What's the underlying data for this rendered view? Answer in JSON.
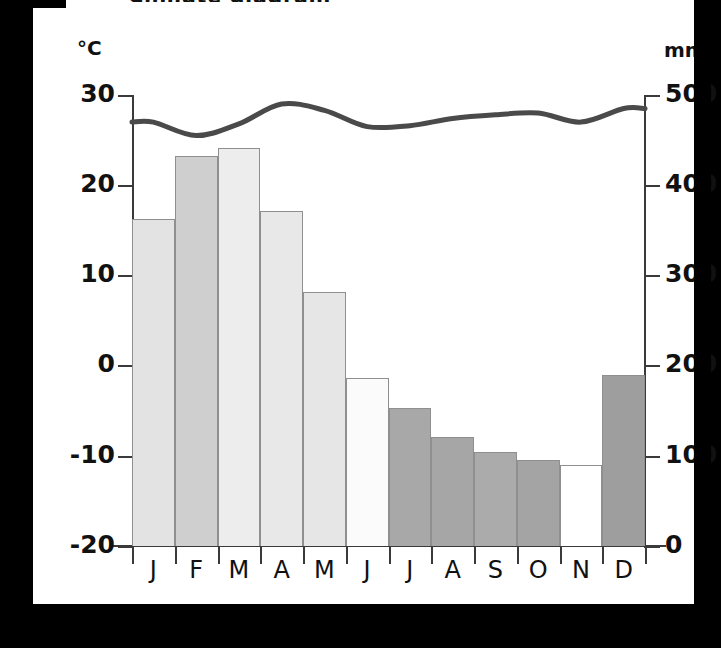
{
  "title_sliver": "Climate diagram",
  "axes": {
    "left_unit": "°C",
    "right_unit": "mm",
    "left_ticks": [
      "30",
      "20",
      "10",
      "0",
      "-10",
      "-20"
    ],
    "right_ticks": [
      "500",
      "400",
      "300",
      "200",
      "100",
      "0"
    ],
    "left_range": [
      -20,
      30
    ],
    "right_range": [
      0,
      500
    ],
    "months": [
      "J",
      "F",
      "M",
      "A",
      "M",
      "J",
      "J",
      "A",
      "S",
      "O",
      "N",
      "D"
    ]
  },
  "colors": {
    "axis": "#3a3a3a",
    "temperature_line": "#4a4a4a",
    "bar_outline": "#8f8f8f",
    "background": "#ffffff",
    "letterbox": "#000000"
  },
  "chart_data": {
    "type": "bar",
    "title": "Climate diagram",
    "xlabel": "",
    "ylabel": "Temperature (°C)",
    "y2label": "Precipitation (mm)",
    "ylim": [
      -20,
      30
    ],
    "y2lim": [
      0,
      500
    ],
    "grid": false,
    "legend": "none",
    "categories": [
      "J",
      "F",
      "M",
      "A",
      "M",
      "J",
      "J",
      "A",
      "S",
      "O",
      "N",
      "D"
    ],
    "series": [
      {
        "name": "Precipitation",
        "type": "bar",
        "axis": "right",
        "unit": "mm",
        "values": [
          363,
          432,
          441,
          371,
          282,
          186,
          153,
          121,
          104,
          95,
          90,
          190
        ],
        "fills": [
          "#e3e3e3",
          "#cfcfcf",
          "#ededed",
          "#e8e8e8",
          "#e6e6e6",
          "#fbfbfb",
          "#a8a8a8",
          "#a6a6a6",
          "#ababab",
          "#a4a4a4",
          "#ffffff",
          "#9e9e9e"
        ]
      },
      {
        "name": "Temperature",
        "type": "line",
        "axis": "left",
        "unit": "°C",
        "values": [
          27.0,
          25.5,
          26.8,
          29.0,
          28.3,
          26.5,
          26.6,
          27.4,
          27.8,
          28.0,
          27.0,
          28.5
        ]
      }
    ]
  }
}
